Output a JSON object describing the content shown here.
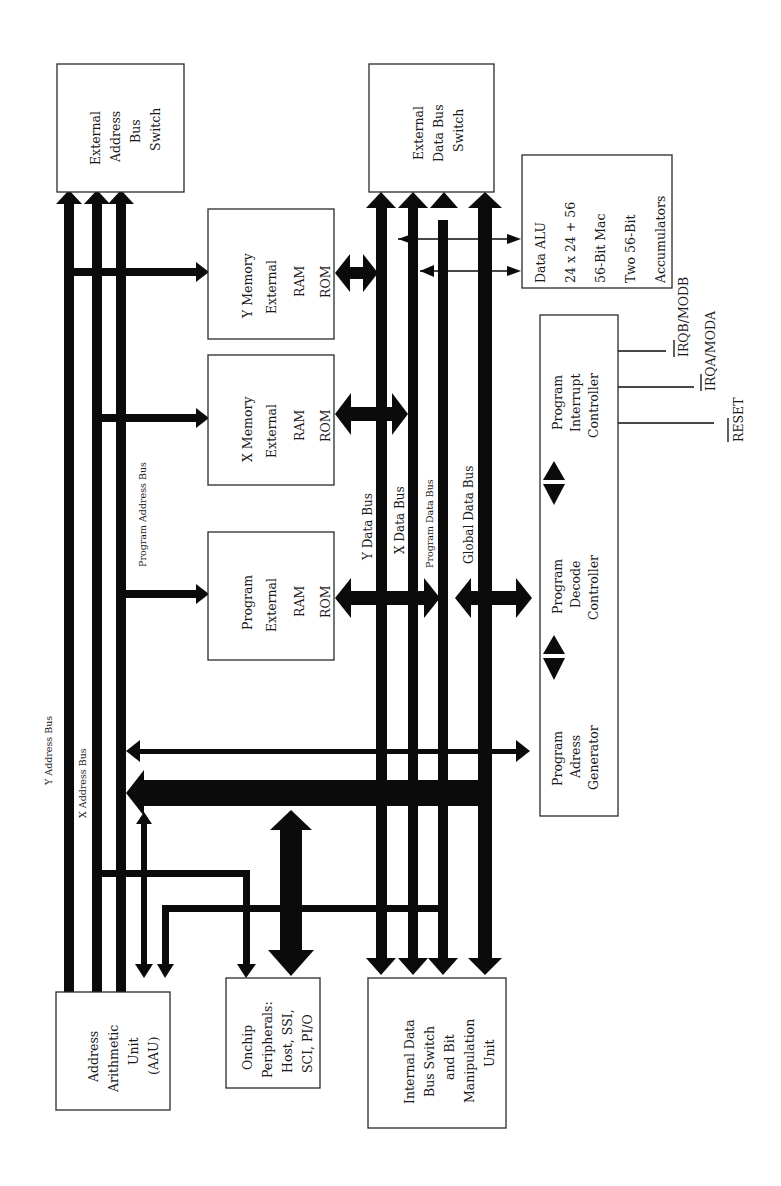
{
  "diagram": {
    "orientation": "rotated 90deg counter-clockwise",
    "blocks": {
      "external_address_bus_switch": {
        "lines": [
          "External",
          "Address",
          "Bus",
          "Switch"
        ]
      },
      "external_data_bus_switch": {
        "lines": [
          "External",
          "Data Bus",
          "Switch"
        ]
      },
      "data_alu": {
        "lines": [
          "Data ALU",
          "24 x 24 + 56",
          "56-Bit Mac",
          "Two 56-Bit",
          "Accumulators"
        ]
      },
      "y_memory": {
        "lines": [
          "Y Memory",
          "External",
          "RAM",
          "ROM"
        ]
      },
      "x_memory": {
        "lines": [
          "X Memory",
          "External",
          "RAM",
          "ROM"
        ]
      },
      "program_memory": {
        "lines": [
          "Program",
          "External",
          "RAM",
          "ROM"
        ]
      },
      "program_interrupt_controller": {
        "lines": [
          "Program",
          "Interrupt",
          "Controller"
        ]
      },
      "program_decode_controller": {
        "lines": [
          "Program",
          "Decode",
          "Controller"
        ]
      },
      "program_address_generator": {
        "lines": [
          "Program",
          "Adress",
          "Generator"
        ]
      },
      "address_arithmetic_unit": {
        "lines": [
          "Address",
          "Arithmetic",
          "Unit",
          "(AAU)"
        ]
      },
      "onchip_peripherals": {
        "lines": [
          "Onchip",
          "Peripherals:",
          "Host, SSI,",
          "SCI, PI/O"
        ]
      },
      "internal_data_bus_switch": {
        "lines": [
          "Internal Data",
          "Bus Switch",
          "and Bit",
          "Manipulation",
          "Unit"
        ]
      }
    },
    "buses": {
      "y_address": "Y Address Bus",
      "x_address": "X Address Bus",
      "program_address": "Program Address Bus",
      "y_data": "Y Data Bus",
      "x_data": "X Data Bus",
      "program_data": "Program Data Bus",
      "global_data": "Global Data Bus"
    },
    "control_signals": {
      "irqb": "IRQB/MODB",
      "irqa": "IRQA/MODA",
      "reset": "RESET"
    },
    "colors": {
      "line": "#0b0b0b",
      "box_border": "#2a2a2a",
      "background": "#ffffff"
    }
  }
}
